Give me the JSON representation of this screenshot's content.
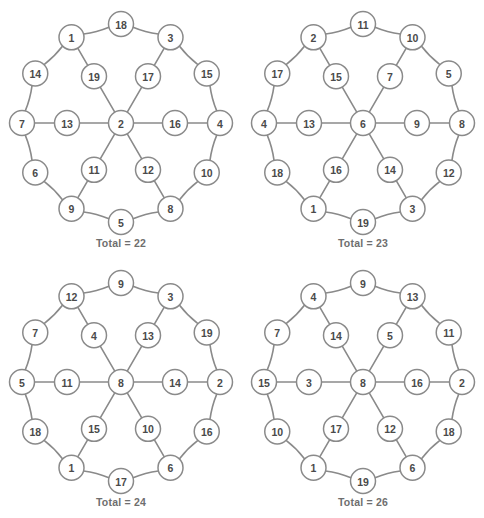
{
  "figure": {
    "kind": "magic-wheel-puzzle-set",
    "panel_count": 4
  },
  "style": {
    "stroke_color": "#8a8a8a",
    "node_fill": "#ffffff",
    "label_color": "#4a4a4a",
    "caption_color": "#6e6e6e",
    "background": "#ffffff"
  },
  "geometry": {
    "center": {
      "x": 121,
      "y": 123
    },
    "hub_radius": 12.5,
    "inner_ring_radius": 54,
    "outer_ring_radius": 99,
    "node_radius": 12.5,
    "spoke_angles_deg": [
      180,
      120,
      60,
      0,
      -60,
      -120
    ],
    "between_angles_deg": [
      150,
      90,
      30,
      -30,
      -90,
      -150
    ]
  },
  "panels": [
    {
      "id": "panel-1",
      "caption": "Total = 22",
      "total": 22,
      "hub": 2,
      "spokes": [
        {
          "angle": 180,
          "inner": 13,
          "outer": 7
        },
        {
          "angle": 120,
          "inner": 19,
          "outer": 1
        },
        {
          "angle": 60,
          "inner": 17,
          "outer": 3
        },
        {
          "angle": 0,
          "inner": 16,
          "outer": 4
        },
        {
          "angle": -60,
          "inner": 12,
          "outer": 8
        },
        {
          "angle": -120,
          "inner": 11,
          "outer": 9
        }
      ],
      "between": [
        {
          "angle": 150,
          "value": 14
        },
        {
          "angle": 90,
          "value": 18
        },
        {
          "angle": 30,
          "value": 15
        },
        {
          "angle": -30,
          "value": 10
        },
        {
          "angle": -90,
          "value": 5
        },
        {
          "angle": -150,
          "value": 6
        }
      ]
    },
    {
      "id": "panel-2",
      "caption": "Total = 23",
      "total": 23,
      "hub": 6,
      "spokes": [
        {
          "angle": 180,
          "inner": 13,
          "outer": 4
        },
        {
          "angle": 120,
          "inner": 15,
          "outer": 2
        },
        {
          "angle": 60,
          "inner": 7,
          "outer": 10
        },
        {
          "angle": 0,
          "inner": 9,
          "outer": 8
        },
        {
          "angle": -60,
          "inner": 14,
          "outer": 3
        },
        {
          "angle": -120,
          "inner": 16,
          "outer": 1
        }
      ],
      "between": [
        {
          "angle": 150,
          "value": 17
        },
        {
          "angle": 90,
          "value": 11
        },
        {
          "angle": 30,
          "value": 5
        },
        {
          "angle": -30,
          "value": 12
        },
        {
          "angle": -90,
          "value": 19
        },
        {
          "angle": -150,
          "value": 18
        }
      ]
    },
    {
      "id": "panel-3",
      "caption": "Total = 24",
      "total": 24,
      "hub": 8,
      "spokes": [
        {
          "angle": 180,
          "inner": 11,
          "outer": 5
        },
        {
          "angle": 120,
          "inner": 4,
          "outer": 12
        },
        {
          "angle": 60,
          "inner": 13,
          "outer": 3
        },
        {
          "angle": 0,
          "inner": 14,
          "outer": 2
        },
        {
          "angle": -60,
          "inner": 10,
          "outer": 6
        },
        {
          "angle": -120,
          "inner": 15,
          "outer": 1
        }
      ],
      "between": [
        {
          "angle": 150,
          "value": 7
        },
        {
          "angle": 90,
          "value": 9
        },
        {
          "angle": 30,
          "value": 19
        },
        {
          "angle": -30,
          "value": 16
        },
        {
          "angle": -90,
          "value": 17
        },
        {
          "angle": -150,
          "value": 18
        }
      ]
    },
    {
      "id": "panel-4",
      "caption": "Total = 26",
      "total": 26,
      "hub": 8,
      "spokes": [
        {
          "angle": 180,
          "inner": 3,
          "outer": 15
        },
        {
          "angle": 120,
          "inner": 14,
          "outer": 4
        },
        {
          "angle": 60,
          "inner": 5,
          "outer": 13
        },
        {
          "angle": 0,
          "inner": 16,
          "outer": 2
        },
        {
          "angle": -60,
          "inner": 12,
          "outer": 6
        },
        {
          "angle": -120,
          "inner": 17,
          "outer": 1
        }
      ],
      "between": [
        {
          "angle": 150,
          "value": 7
        },
        {
          "angle": 90,
          "value": 9
        },
        {
          "angle": 30,
          "value": 11
        },
        {
          "angle": -30,
          "value": 18
        },
        {
          "angle": -90,
          "value": 19
        },
        {
          "angle": -150,
          "value": 10
        }
      ]
    }
  ]
}
